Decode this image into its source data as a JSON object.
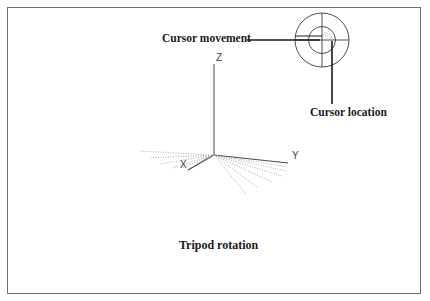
{
  "diagram": {
    "caption": "Tripod rotation",
    "callouts": {
      "cursor_movement": "Cursor movement",
      "cursor_location": "Cursor location"
    },
    "axes": {
      "x": "X",
      "y": "Y",
      "z": "Z"
    },
    "icons": {
      "trackball": "trackball-circles-icon",
      "tripod": "3d-axis-tripod-icon"
    },
    "colors": {
      "lines": "#3a3a3a",
      "dotted": "#9a9a9a",
      "frame": "#6e6e6e"
    }
  }
}
